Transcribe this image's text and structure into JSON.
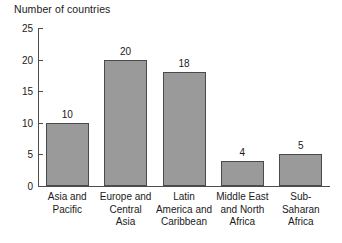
{
  "chart_data": {
    "type": "bar",
    "title": "Number of countries",
    "xlabel": "",
    "ylabel": "Number of countries",
    "ylim": [
      0,
      25
    ],
    "yticks": [
      0,
      5,
      10,
      15,
      20,
      25
    ],
    "grid": false,
    "legend": "none",
    "bar_color": "#9a9a9a",
    "bar_edge_color": "#4a4a4a",
    "axis_color": "#4d4d4d",
    "background": "#ffffff",
    "show_value_labels": true,
    "categories": [
      "Asia and Pacific",
      "Europe and Central Asia",
      "Latin America and Caribbean",
      "Middle East and North Africa",
      "Sub-Saharan Africa"
    ],
    "category_lines": [
      [
        "Asia and",
        "Pacific"
      ],
      [
        "Europe and",
        "Central",
        "Asia"
      ],
      [
        "Latin",
        "America and",
        "Caribbean"
      ],
      [
        "Middle East",
        "and North",
        "Africa"
      ],
      [
        "Sub-",
        "Saharan",
        "Africa"
      ]
    ],
    "values": [
      10,
      20,
      18,
      4,
      5
    ],
    "value_labels": [
      "10",
      "20",
      "18",
      "4",
      "5"
    ],
    "ytick_labels": [
      "0",
      "5",
      "10",
      "15",
      "20",
      "25"
    ]
  }
}
